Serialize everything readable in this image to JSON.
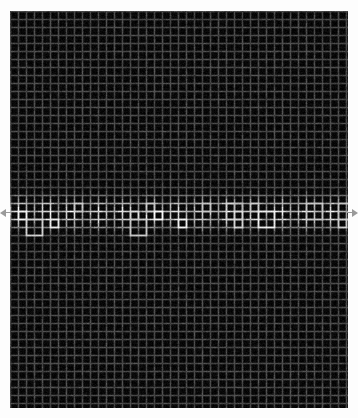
{
  "figure": {
    "title": "Scintillating grid contrast-band stimulus",
    "description": "Dark square grid with thin light lines; a horizontal band across the vertical middle has higher-luminance lines forming a wavy scalloped envelope. Small triangular markers on the left and right image edges indicate the vertical centre of the band.",
    "canvas_width": 358,
    "canvas_height": 418
  },
  "colors": {
    "page_background": "#fdfdfd",
    "plate_background": "#050505",
    "grid_line_dim": "#6a6a6a",
    "grid_line_bright": "#f2f2f2",
    "marker": "#9a9a9a"
  },
  "plate": {
    "left": 10,
    "top": 11,
    "width": 338,
    "height": 397
  },
  "grid": {
    "pitch_px": 8.0,
    "line_width_px": 1.6,
    "columns": 43,
    "rows": 50,
    "base_line_luminance": 0.3,
    "noise_amount": 0.16
  },
  "band": {
    "center_y": 213,
    "half_height_px": 26,
    "peak_line_luminance": 0.97,
    "envelope": "cosine",
    "modulation_periods": 6.5,
    "modulation_depth": 0.45,
    "modulation_phase_deg": 15
  },
  "markers": {
    "left": {
      "name": "left-edge-pointer",
      "x": 0,
      "y": 213,
      "direction": "right"
    },
    "right": {
      "name": "right-edge-pointer",
      "x": 358,
      "y": 213,
      "direction": "left"
    }
  },
  "chart_data": {
    "type": "heatmap",
    "title": "Scintillating grid contrast-band stimulus",
    "xlabel": "",
    "ylabel": "",
    "grid": true,
    "legend": "none",
    "xlim": [
      0,
      43
    ],
    "ylim": [
      0,
      50
    ],
    "categories": [
      "grid column index"
    ],
    "series": [
      {
        "name": "line luminance vs vertical position (row index)",
        "x": [
          0,
          5,
          10,
          15,
          18,
          20,
          22,
          24,
          26,
          28,
          30,
          32,
          35,
          40,
          45,
          50
        ],
        "values": [
          0.3,
          0.3,
          0.3,
          0.34,
          0.52,
          0.75,
          0.93,
          0.97,
          0.93,
          0.75,
          0.52,
          0.36,
          0.3,
          0.3,
          0.3,
          0.3
        ]
      },
      {
        "name": "band peak luminance vs horizontal position (column index)",
        "x": [
          0,
          3,
          6,
          9,
          12,
          15,
          18,
          21,
          24,
          27,
          30,
          33,
          36,
          39,
          43
        ],
        "values": [
          0.6,
          0.95,
          0.62,
          0.93,
          0.58,
          0.9,
          0.61,
          0.94,
          0.59,
          0.88,
          0.96,
          0.64,
          0.97,
          0.7,
          0.92
        ]
      }
    ]
  }
}
